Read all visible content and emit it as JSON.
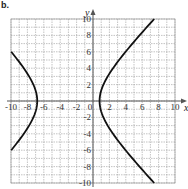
{
  "chart_data": {
    "type": "line",
    "title": "",
    "question_label": "b.",
    "xlabel": "x",
    "ylabel": "y",
    "xlim": [
      -10,
      10
    ],
    "ylim": [
      -10,
      10
    ],
    "grid": true,
    "grid_step": 1,
    "x_ticks": [
      -10,
      -8,
      -6,
      -4,
      -2,
      0,
      2,
      4,
      6,
      8,
      10
    ],
    "x_tick_labels": [
      "-10",
      "-8",
      "-6",
      "-4",
      "-2",
      "0",
      "2",
      "4",
      "6",
      "8",
      "10"
    ],
    "y_ticks": [
      10,
      8,
      6,
      4,
      2,
      -2,
      -4,
      -6,
      -8,
      -10
    ],
    "y_tick_labels": [
      "10",
      "8",
      "6",
      "4",
      "2",
      "-2",
      "-4",
      "-6",
      "-8",
      "-10"
    ],
    "curve": {
      "kind": "hyperbola",
      "equation": "(x+3)^2/14.44 - y^2/15.2 = 1",
      "center": [
        -3,
        0
      ],
      "a": 3.8,
      "b": 3.9,
      "vertices": [
        [
          -6.8,
          0
        ],
        [
          0.8,
          0
        ]
      ],
      "left_branch_endpoints": [
        [
          -10,
          6
        ],
        [
          -10,
          -6
        ]
      ],
      "right_branch_endpoints": [
        [
          7.8,
          10
        ],
        [
          7.8,
          -10
        ]
      ]
    },
    "colors": {
      "curve": "#111111",
      "grid": "#9a9a9a",
      "axis": "#555555"
    }
  }
}
